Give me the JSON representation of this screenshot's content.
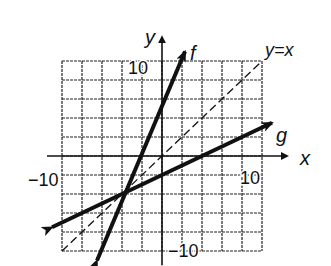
{
  "chart_data": {
    "type": "line",
    "title": "",
    "xlabel": "x",
    "ylabel": "y",
    "xlim": [
      -10,
      10
    ],
    "ylim": [
      -10,
      10
    ],
    "grid": true,
    "grid_step": 2,
    "tick_labels": {
      "x_neg": "−10",
      "x_pos": "10",
      "y_pos": "10",
      "y_neg": "−10"
    },
    "series": [
      {
        "name": "f",
        "style": "solid-bold-arrows",
        "points": [
          [
            -6.5,
            -11
          ],
          [
            2.3,
            11
          ]
        ],
        "y_intercept": 4
      },
      {
        "name": "g",
        "style": "solid-bold-arrows",
        "points": [
          [
            -11,
            -7.5
          ],
          [
            11,
            3.5
          ]
        ],
        "y_intercept": -2
      },
      {
        "name": "y=x",
        "style": "dashed",
        "points": [
          [
            -10,
            -10
          ],
          [
            10,
            10
          ]
        ]
      }
    ],
    "annotations": [
      "f",
      "g",
      "y=x"
    ],
    "intersection_f_g": [
      -4,
      -4
    ]
  }
}
